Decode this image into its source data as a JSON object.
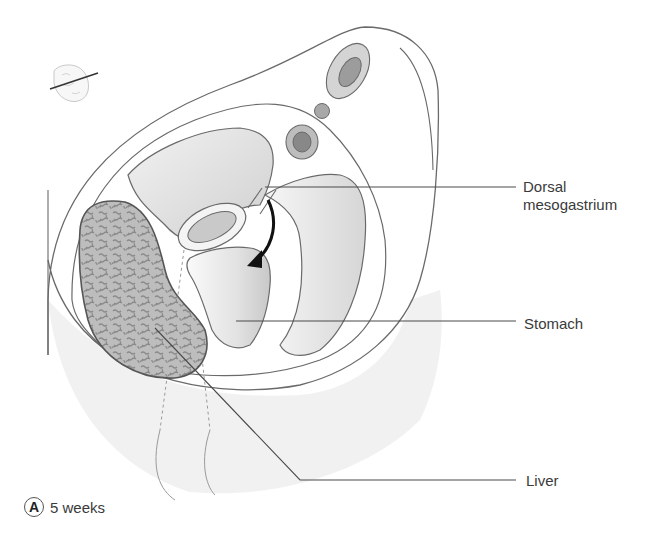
{
  "figure": {
    "panel_letter": "A",
    "stage_caption": "5 weeks",
    "orientation_inset": "embryo-section-plane-icon",
    "rotation_arrow": "curved-arrow-clockwise"
  },
  "labels": [
    {
      "id": "dorsal_mesogastrium",
      "line1": "Dorsal",
      "line2": "mesogastrium"
    },
    {
      "id": "stomach",
      "text": "Stomach"
    },
    {
      "id": "liver",
      "text": "Liver"
    }
  ],
  "colors": {
    "outline": "#6a6a6a",
    "leader_line": "#4a4a4a",
    "cavity_fill": "#e4e4e4",
    "vessel_ring": "#d2d2d2",
    "vessel_core": "#9a9a9a",
    "liver_fill": "#b7b7b7",
    "liver_pattern": "#8e8e8e",
    "arrow": "#111111",
    "text": "#3a3a3a"
  }
}
